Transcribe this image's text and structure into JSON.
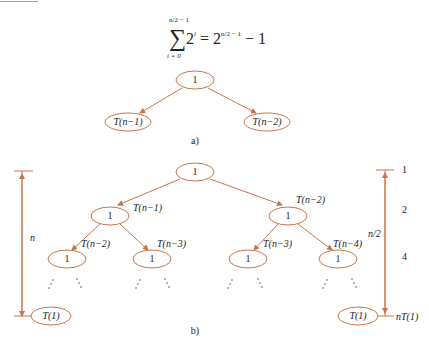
{
  "formula": {
    "sum_symbol": "∑",
    "upper_limit": "n/2 − 1",
    "lower_limit": "i = 0",
    "base": "2",
    "exponent_i": "i",
    "equals": "=",
    "rhs_base": "2",
    "rhs_exponent": "n/2 − 1",
    "rhs_tail": "− 1"
  },
  "part_a": {
    "caption": "a)",
    "root": "1",
    "left_child": "T(n−1)",
    "right_child": "T(n−2)"
  },
  "part_b": {
    "caption": "b)",
    "root": "1",
    "level1": [
      {
        "node": "1",
        "edge_label": "T(n−1)"
      },
      {
        "node": "1",
        "edge_label": "T(n−2)"
      }
    ],
    "level2": [
      {
        "node": "1",
        "edge_label": "T(n−2)"
      },
      {
        "node": "1",
        "edge_label": "T(n−3)"
      },
      {
        "node": "1",
        "edge_label": "T(n−3)"
      },
      {
        "node": "1",
        "edge_label": "T(n−4)"
      }
    ],
    "ellipsis": "⋰ ⋱",
    "leaf_left": "T(1)",
    "leaf_right": "T(1)",
    "left_height_label": "n",
    "right_height_label": "n/2",
    "level_counts": [
      "1",
      "2",
      "4"
    ],
    "bottom_count": "nT(1)"
  },
  "colors": {
    "stroke": "#c8744a",
    "text": "#222222"
  }
}
